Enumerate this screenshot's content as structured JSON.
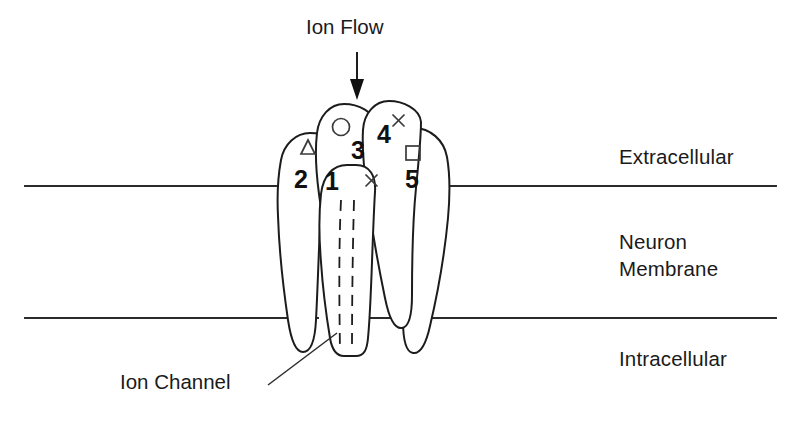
{
  "diagram": {
    "title_annotation": "Ion Flow",
    "channel_annotation": "Ion Channel",
    "regions": {
      "extracellular": "Extracellular",
      "membrane": "Neuron\nMembrane",
      "intracellular": "Intracellular"
    },
    "subunits": [
      {
        "number": "1",
        "symbol": "x-mark",
        "symbol_glyph": "×"
      },
      {
        "number": "2",
        "symbol": "triangle",
        "symbol_glyph": "△"
      },
      {
        "number": "3",
        "symbol": "circle",
        "symbol_glyph": "○"
      },
      {
        "number": "4",
        "symbol": "x-mark",
        "symbol_glyph": "×"
      },
      {
        "number": "5",
        "symbol": "square",
        "symbol_glyph": "□"
      }
    ],
    "colors": {
      "ink": "#1c1c1c",
      "membrane_line": "#2b2b2b",
      "symbol": "#3a3a3a",
      "background": "#ffffff"
    }
  }
}
